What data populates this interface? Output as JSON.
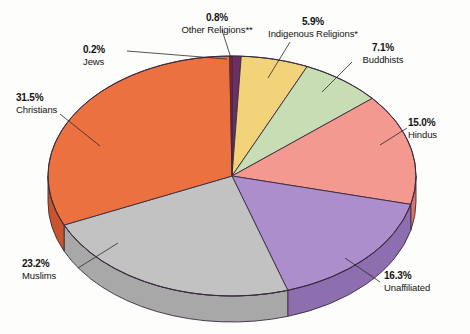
{
  "chart_data": {
    "type": "pie",
    "title": "",
    "subtitle": "",
    "xlabel": "",
    "ylabel": "",
    "legend_position": "callout-labels",
    "grid": false,
    "units": "percent",
    "total": 100.0,
    "categories": [
      "Christians",
      "Muslims",
      "Unaffiliated",
      "Hindus",
      "Buddhists",
      "Indigenous Religions*",
      "Other Religions**",
      "Jews"
    ],
    "values": [
      31.5,
      23.2,
      16.3,
      15.0,
      7.1,
      5.9,
      0.8,
      0.2
    ],
    "slices": [
      {
        "label": "Christians",
        "value": 31.5,
        "value_text": "31.5%",
        "color": "#ec7140",
        "side_color": "#c9552b",
        "label_align": "left",
        "id": "christians"
      },
      {
        "label": "Muslims",
        "value": 23.2,
        "value_text": "23.2%",
        "color": "#c2c2c2",
        "side_color": "#a8a8a8",
        "label_align": "left",
        "id": "muslims"
      },
      {
        "label": "Unaffiliated",
        "value": 16.3,
        "value_text": "16.3%",
        "color": "#ab8ecb",
        "side_color": "#8d6fb0",
        "label_align": "left",
        "id": "unaffiliated"
      },
      {
        "label": "Hindus",
        "value": 15.0,
        "value_text": "15.0%",
        "color": "#f4998f",
        "side_color": "#d9756a",
        "label_align": "left",
        "id": "hindus"
      },
      {
        "label": "Buddhists",
        "value": 7.1,
        "value_text": "7.1%",
        "color": "#c7ddb4",
        "side_color": "#a7c392",
        "label_align": "left",
        "id": "buddhists"
      },
      {
        "label": "Indigenous Religions*",
        "value": 5.9,
        "value_text": "5.9%",
        "color": "#f2d37a",
        "side_color": "#d4b259",
        "label_align": "center",
        "id": "indigenous"
      },
      {
        "label": "Other Religions**",
        "value": 0.8,
        "value_text": "0.8%",
        "color": "#6b2f63",
        "side_color": "#4e2049",
        "label_align": "center",
        "id": "other-religions"
      },
      {
        "label": "Jews",
        "value": 0.2,
        "value_text": "0.2%",
        "color": "#a52020",
        "side_color": "#7d1616",
        "label_align": "left",
        "id": "jews"
      }
    ],
    "footnote_markers": [
      "*",
      "**"
    ],
    "outline_color": "#3a2a3f",
    "background": "#fdfdfb"
  },
  "labels": {
    "other_religions": {
      "percent": "0.8%",
      "name": "Other Religions**"
    },
    "indigenous": {
      "percent": "5.9%",
      "name": "Indigenous Religions*"
    },
    "buddhists": {
      "percent": "7.1%",
      "name": "Buddhists"
    },
    "hindus": {
      "percent": "15.0%",
      "name": "Hindus"
    },
    "unaffiliated": {
      "percent": "16.3%",
      "name": "Unaffiliated"
    },
    "muslims": {
      "percent": "23.2%",
      "name": "Muslims"
    },
    "christians": {
      "percent": "31.5%",
      "name": "Christians"
    },
    "jews": {
      "percent": "0.2%",
      "name": "Jews"
    }
  }
}
